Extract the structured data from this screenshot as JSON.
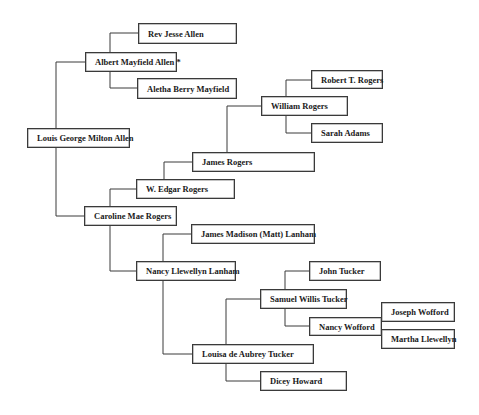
{
  "diagram": {
    "type": "pedigree-chart",
    "people": [
      {
        "id": "louis",
        "name": "Louis George Milton Allen",
        "box": [
          27,
          128,
          103,
          20
        ]
      },
      {
        "id": "albert",
        "name": "Albert Mayfield Allen *",
        "box": [
          85,
          52,
          92,
          20
        ]
      },
      {
        "id": "rev_jesse",
        "name": "Rev Jesse Allen",
        "box": [
          138,
          23,
          99,
          21
        ]
      },
      {
        "id": "aletha",
        "name": "Aletha Berry Mayfield",
        "box": [
          137,
          78,
          100,
          21
        ]
      },
      {
        "id": "caroline",
        "name": "Caroline Mae Rogers",
        "box": [
          84,
          206,
          93,
          20
        ]
      },
      {
        "id": "w_edgar",
        "name": "W. Edgar Rogers",
        "box": [
          136,
          179,
          99,
          20
        ]
      },
      {
        "id": "james_rogers",
        "name": "James Rogers",
        "box": [
          192,
          152,
          123,
          20
        ]
      },
      {
        "id": "william",
        "name": "William Rogers",
        "box": [
          261,
          96,
          87,
          20
        ]
      },
      {
        "id": "robert",
        "name": "Robert T. Rogers",
        "box": [
          311,
          70,
          72,
          19
        ]
      },
      {
        "id": "sarah",
        "name": "Sarah Adams",
        "box": [
          311,
          123,
          72,
          20
        ]
      },
      {
        "id": "nancy_llewellyn",
        "name": "Nancy Llewellyn Lanham",
        "box": [
          136,
          261,
          100,
          20
        ]
      },
      {
        "id": "james_madison",
        "name": "James Madison (Matt) Lanham",
        "box": [
          191,
          224,
          124,
          20
        ]
      },
      {
        "id": "louisa",
        "name": "Louisa de Aubrey Tucker",
        "box": [
          192,
          344,
          122,
          20
        ]
      },
      {
        "id": "samuel",
        "name": "Samuel Willis Tucker",
        "box": [
          260,
          289,
          87,
          20
        ]
      },
      {
        "id": "john_tucker",
        "name": "John Tucker",
        "box": [
          309,
          261,
          72,
          20
        ]
      },
      {
        "id": "nancy_wofford",
        "name": "Nancy Wofford",
        "box": [
          309,
          317,
          72,
          19
        ]
      },
      {
        "id": "joseph",
        "name": "Joseph Wofford",
        "box": [
          381,
          302,
          73,
          20
        ]
      },
      {
        "id": "martha",
        "name": "Martha Llewellyn",
        "box": [
          381,
          329,
          73,
          20
        ]
      },
      {
        "id": "dicey",
        "name": "Dicey Howard",
        "box": [
          260,
          371,
          87,
          20
        ]
      }
    ],
    "connectors": [
      {
        "parent_of": "louis",
        "father": "albert",
        "mother": "caroline"
      },
      {
        "parent_of": "albert",
        "father": "rev_jesse",
        "mother": "aletha"
      },
      {
        "parent_of": "caroline",
        "father": "w_edgar",
        "mother": "nancy_llewellyn"
      },
      {
        "parent_of": "w_edgar",
        "father": "james_rogers"
      },
      {
        "parent_of": "james_rogers",
        "father": "william"
      },
      {
        "parent_of": "william",
        "father": "robert",
        "mother": "sarah"
      },
      {
        "parent_of": "nancy_llewellyn",
        "father": "james_madison",
        "mother": "louisa"
      },
      {
        "parent_of": "louisa",
        "father": "samuel",
        "mother": "dicey"
      },
      {
        "parent_of": "samuel",
        "father": "john_tucker",
        "mother": "nancy_wofford"
      },
      {
        "parent_of": "nancy_wofford",
        "father": "joseph",
        "mother": "martha"
      }
    ]
  }
}
